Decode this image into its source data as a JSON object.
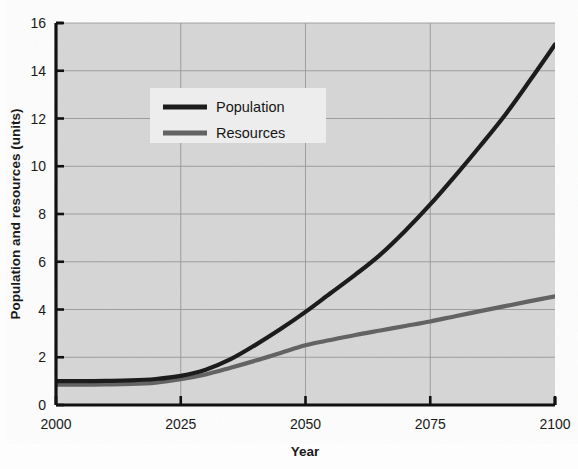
{
  "figure": {
    "background_color": "#fdfdfd",
    "plot_background_color": "#d6d6d6",
    "grid_color": "#8c8c8c",
    "axis_color": "#111111"
  },
  "chart_data": {
    "type": "line",
    "title": "",
    "subtitle": "",
    "xlabel": "Year",
    "ylabel": "Population and resources (units)",
    "xlim": [
      2000,
      2100
    ],
    "ylim": [
      0,
      16
    ],
    "xticks": [
      2000,
      2025,
      2050,
      2075,
      2100
    ],
    "xtick_labels": [
      "2000",
      "2025",
      "2050",
      "2075",
      "2100"
    ],
    "yticks": [
      0,
      2,
      4,
      6,
      8,
      10,
      12,
      14,
      16
    ],
    "ytick_labels": [
      "0",
      "2",
      "4",
      "6",
      "8",
      "10",
      "12",
      "14",
      "16"
    ],
    "grid": true,
    "grid_axes": "both",
    "legend_position": "upper-left-center",
    "x": [
      2000,
      2005,
      2010,
      2015,
      2020,
      2025,
      2030,
      2035,
      2040,
      2045,
      2050,
      2055,
      2060,
      2065,
      2070,
      2075,
      2080,
      2085,
      2090,
      2095,
      2100
    ],
    "series": [
      {
        "name": "Population",
        "color": "#1c1c1c",
        "line_width": 4.2,
        "values": [
          1.0,
          1.0,
          1.01,
          1.03,
          1.09,
          1.22,
          1.48,
          1.92,
          2.52,
          3.18,
          3.9,
          4.68,
          5.46,
          6.3,
          7.3,
          8.4,
          9.6,
          10.85,
          12.15,
          13.6,
          15.1
        ]
      },
      {
        "name": "Resources",
        "color": "#636363",
        "line_width": 4.2,
        "values": [
          0.85,
          0.85,
          0.86,
          0.88,
          0.94,
          1.08,
          1.28,
          1.56,
          1.86,
          2.18,
          2.5,
          2.72,
          2.93,
          3.12,
          3.31,
          3.5,
          3.72,
          3.93,
          4.14,
          4.35,
          4.55
        ]
      }
    ],
    "legend_entries": [
      {
        "label": "Population",
        "color": "#1c1c1c"
      },
      {
        "label": "Resources",
        "color": "#636363"
      }
    ]
  }
}
